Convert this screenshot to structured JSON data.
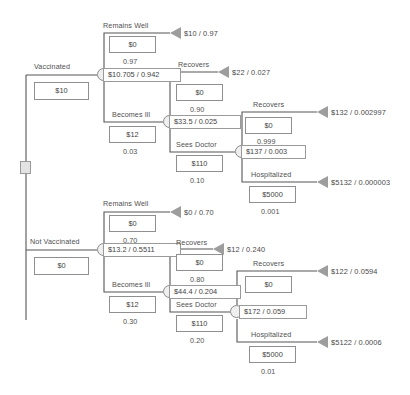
{
  "diagram": {
    "root": {
      "name": "decision-node",
      "type": "decision"
    },
    "colors": {
      "line": "#555555",
      "node_fill": "#efefef",
      "node_stroke": "#8a8a8a",
      "terminal": "#9d9d9d",
      "text": "#4a4a4a"
    },
    "branches": [
      {
        "id": "vaccinated",
        "label": "Vaccinated",
        "cost": "$10",
        "node_value": "$10.705 / 0.942",
        "children": [
          {
            "id": "vacc-remains-well",
            "label": "Remains Well",
            "cost": "$0",
            "prob": "0.97",
            "terminal": "$10 / 0.97"
          },
          {
            "id": "vacc-becomes-ill",
            "label": "Becomes Ill",
            "cost": "$12",
            "prob": "0.03",
            "node_value": "$33.5 / 0.025",
            "children": [
              {
                "id": "vacc-ill-recovers",
                "label": "Recovers",
                "cost": "$0",
                "prob": "0.90",
                "terminal": "$22 / 0.027"
              },
              {
                "id": "vacc-ill-sees-doctor",
                "label": "Sees Doctor",
                "cost": "$110",
                "prob": "0.10",
                "node_value": "$137 / 0.003",
                "children": [
                  {
                    "id": "vacc-doc-recovers",
                    "label": "Recovers",
                    "cost": "$0",
                    "prob": "0.999",
                    "terminal": "$132 / 0.002997"
                  },
                  {
                    "id": "vacc-doc-hospitalized",
                    "label": "Hospitalized",
                    "cost": "$5000",
                    "prob": "0.001",
                    "terminal": "$5132 / 0.000003"
                  }
                ]
              }
            ]
          }
        ]
      },
      {
        "id": "not-vaccinated",
        "label": "Not Vaccinated",
        "cost": "$0",
        "node_value": "$13.2 / 0.5511",
        "children": [
          {
            "id": "nv-remains-well",
            "label": "Remains Well",
            "cost": "$0",
            "prob": "0.70",
            "terminal": "$0 / 0.70"
          },
          {
            "id": "nv-becomes-ill",
            "label": "Becomes Ill",
            "cost": "$12",
            "prob": "0.30",
            "node_value": "$44.4 / 0.204",
            "children": [
              {
                "id": "nv-ill-recovers",
                "label": "Recovers",
                "cost": "$0",
                "prob": "0.80",
                "terminal": "$12 / 0.240"
              },
              {
                "id": "nv-ill-sees-doctor",
                "label": "Sees Doctor",
                "cost": "$110",
                "prob": "0.20",
                "node_value": "$172 / 0.059",
                "children": [
                  {
                    "id": "nv-doc-recovers",
                    "label": "Recovers",
                    "cost": "$0",
                    "prob": "0.999",
                    "terminal": "$122 / 0.0594"
                  },
                  {
                    "id": "nv-doc-hospitalized",
                    "label": "Hospitalized",
                    "cost": "$5000",
                    "prob": "0.01",
                    "terminal": "$5122 / 0.0006"
                  }
                ]
              }
            ]
          }
        ]
      }
    ]
  }
}
